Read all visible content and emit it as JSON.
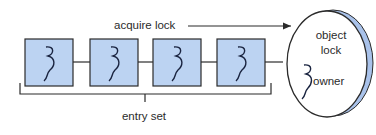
{
  "diagram": {
    "labels": {
      "acquire_lock": "acquire lock",
      "entry_set": "entry set",
      "object_line1": "object",
      "object_line2": "lock",
      "owner": "owner"
    },
    "threads_in_entry_set": 4,
    "colors": {
      "box_fill": "#bcd3f2",
      "stroke": "#2b2b2b",
      "ellipse_shadow": "#a9c2ea",
      "thread_squiggle": "#1a2440"
    }
  }
}
